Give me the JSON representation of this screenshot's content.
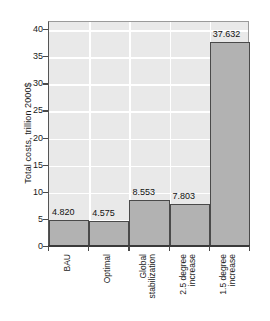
{
  "chart_data": {
    "type": "bar",
    "title": "",
    "xlabel": "",
    "ylabel": "Total costs, trillion 2000$",
    "categories": [
      "BAU",
      "Global stabilization",
      "Optimal",
      "2.5 degree increase",
      "1.5 degree increase"
    ],
    "category_lines": [
      [
        "BAU"
      ],
      [
        "Optimal"
      ],
      [
        "Global",
        "stabilization"
      ],
      [
        "2.5 degree",
        "increase"
      ],
      [
        "1.5 degree",
        "increase"
      ]
    ],
    "categories_ordered": [
      "BAU",
      "Optimal",
      "Global stabilization",
      "2.5 degree increase",
      "1.5 degree increase"
    ],
    "values": [
      4.82,
      4.575,
      8.553,
      7.803,
      37.632
    ],
    "value_labels": [
      "4.820",
      "4.575",
      "8.553",
      "7.803",
      "37.632"
    ],
    "ylim": [
      0,
      41.5
    ],
    "yticks": [
      0,
      5,
      10,
      15,
      20,
      25,
      30,
      35,
      40
    ],
    "ytick_labels": [
      "0",
      "5",
      "10",
      "15",
      "20",
      "25",
      "30",
      "35",
      "40"
    ],
    "grid": "horizontal-and-vertical",
    "legend": "none",
    "colors": {
      "bar_fill": "#b2b2b2",
      "bar_edge": "#4a4a4a",
      "plot_background": "#e9e9e9",
      "gridline": "#ffffff",
      "axis": "#3a3a3a",
      "text": "#1a1a1a",
      "page_background": "#ffffff"
    }
  }
}
